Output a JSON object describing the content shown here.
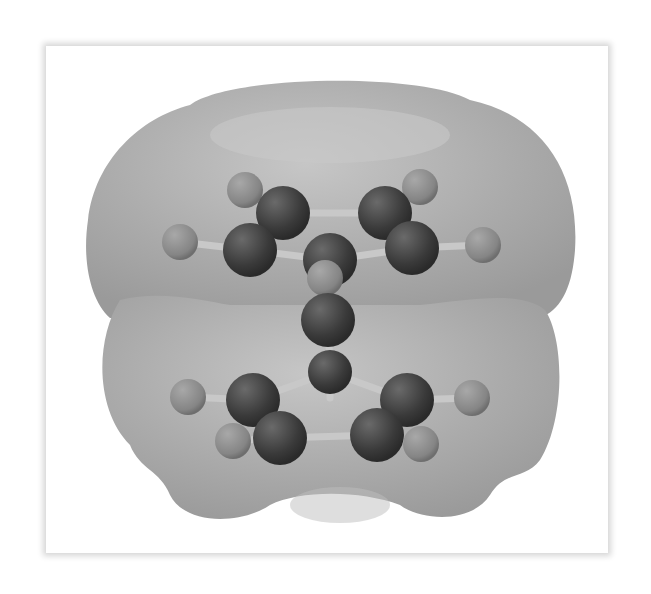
{
  "figure": {
    "rendering": "ball-and-stick with translucent electron density surface",
    "colors": {
      "surface": "#a8a8a8",
      "surface_highlight": "#c4c4c4",
      "carbon_atom": "#3c3c3c",
      "hydrogen_atom": "#8a8a8a",
      "metal_atom": "#333333",
      "bond": "#c8c8c8",
      "frame_shadow": "#d6d6d6"
    },
    "rings": [
      {
        "name": "upper-ring",
        "atom_count": 5,
        "hydrogen_count": 5
      },
      {
        "name": "lower-ring",
        "atom_count": 5,
        "hydrogen_count": 5
      }
    ],
    "center_atom": "metal"
  }
}
